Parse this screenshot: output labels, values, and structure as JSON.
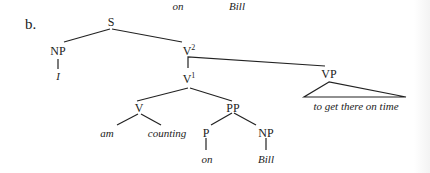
{
  "top_fragment": {
    "left_word": "on",
    "right_word": "Bill"
  },
  "example_label": "b.",
  "tree": {
    "S": "S",
    "NP_subject": "NP",
    "subject_word": "I",
    "V2": "V",
    "V2_sup": "2",
    "V1": "V",
    "V1_sup": "1",
    "VP": "VP",
    "VP_text": "to get there on time",
    "V": "V",
    "am": "am",
    "counting": "counting",
    "PP": "PP",
    "P": "P",
    "on": "on",
    "NP_object": "NP",
    "Bill": "Bill"
  }
}
